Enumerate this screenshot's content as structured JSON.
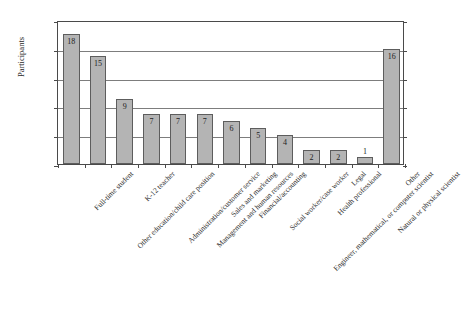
{
  "chart_data": {
    "type": "bar",
    "title": "",
    "xlabel": "",
    "ylabel": "Participants",
    "ylim": [
      0,
      20
    ],
    "ytick_labels": [
      "0%",
      "4%",
      "8%",
      "12%",
      "16%",
      "20%"
    ],
    "ytick_values": [
      0,
      4,
      8,
      12,
      16,
      20
    ],
    "grid": true,
    "legend": "none",
    "value_unit": "percent",
    "categories": [
      "Full-time student",
      "Other education/child care position",
      "K-12 teacher",
      "Administration/customer service",
      "Management and human resources",
      "Sales and marketing",
      "Financial/accounting",
      "Social worker/case worker",
      "Engineer, mathematical, or computer scientist",
      "Health professional",
      "Legal",
      "Natural or physical scientist",
      "Other"
    ],
    "values": [
      18,
      15,
      9,
      7,
      7,
      7,
      6,
      5,
      4,
      2,
      2,
      1,
      16
    ],
    "data_labels": [
      "18",
      "15",
      "9",
      "7",
      "7",
      "7",
      "6",
      "5",
      "4",
      "2",
      "2",
      "1",
      "16"
    ],
    "label_placement": [
      "inside",
      "inside",
      "inside",
      "inside",
      "inside",
      "inside",
      "inside",
      "inside",
      "inside",
      "inside",
      "inside",
      "outside",
      "inside"
    ],
    "bar_color": "#b4b4b4",
    "bar_border_color": "#5d5d5d",
    "axis_color": "#4a4a4a",
    "grid_color": "#7d7d7d"
  }
}
